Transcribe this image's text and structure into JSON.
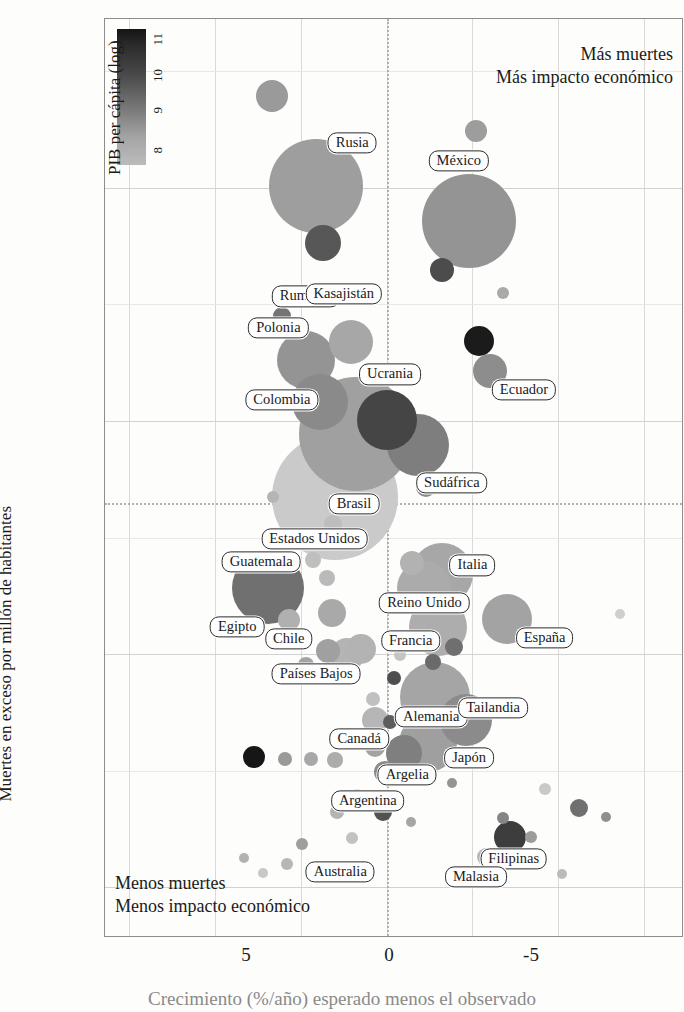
{
  "chart_data": {
    "type": "scatter",
    "title": "",
    "xlabel": "Crecimiento (%/año) esperado menos el observado",
    "ylabel": "Muertes en exceso por millón de habitantes",
    "xticks": [
      "5",
      "0",
      "-5"
    ],
    "xtick_values": [
      5,
      0,
      -5
    ],
    "yticks": [
      "0",
      "2000",
      "4000",
      "6000"
    ],
    "ytick_values": [
      0,
      2000,
      4000,
      6000
    ],
    "xlim": [
      8.2,
      -8.6
    ],
    "ylim": [
      -420,
      7450
    ],
    "grid": true,
    "reference_lines": {
      "vertical_x": 0,
      "horizontal_y": 3300
    },
    "legend": {
      "title": "PIB per cápita (log)",
      "position": "top-left-inside",
      "ticks": [
        "8",
        "9",
        "10",
        "11"
      ],
      "tick_values": [
        8,
        9,
        10,
        11
      ],
      "colormap_low": "#bcbcbc",
      "colormap_high": "#151515"
    },
    "annotations": {
      "top_right_line1": "Más muertes",
      "top_right_line2": "Más impacto económico",
      "bottom_left_line1": "Menos muertes",
      "bottom_left_line2": "Menos impacto económico"
    },
    "size_encoding": "población",
    "points": [
      {
        "name": "Rusia",
        "x": 2.05,
        "y": 6020,
        "r": 47,
        "gdp": 9.3,
        "color": "#9e9e9e",
        "label": true,
        "lx": 1.0,
        "ly": 6390
      },
      {
        "name": "Rumania",
        "x": 1.85,
        "y": 5530,
        "r": 18,
        "gdp": 10.6,
        "color": "#575757",
        "label": true,
        "lx": 2.35,
        "ly": 5070
      },
      {
        "name": "México",
        "x": -2.4,
        "y": 5720,
        "r": 47,
        "gdp": 9.8,
        "color": "#949494",
        "label": true,
        "lx": -2.1,
        "ly": 6230
      },
      {
        "name": "Ecuador",
        "x": -3.0,
        "y": 4430,
        "r": 17,
        "gdp": 9.3,
        "color": "#8d8d8d",
        "label": true,
        "lx": -4.0,
        "ly": 4270
      },
      {
        "name": "Kasajistán",
        "x": 1.05,
        "y": 4680,
        "r": 22,
        "gdp": 9.6,
        "color": "#a7a7a7",
        "label": true,
        "lx": 1.25,
        "ly": 5090
      },
      {
        "name": "Polonia",
        "x": 2.35,
        "y": 4520,
        "r": 29,
        "gdp": 10.4,
        "color": "#949494",
        "label": true,
        "lx": 3.15,
        "ly": 4800
      },
      {
        "name": "Colombia",
        "x": 1.95,
        "y": 4160,
        "r": 28,
        "gdp": 9.6,
        "color": "#8a8a8a",
        "label": true,
        "lx": 3.05,
        "ly": 4180
      },
      {
        "name": "Ucrania",
        "x": 0.0,
        "y": 4010,
        "r": 30,
        "gdp": 9.2,
        "color": "#454545",
        "label": true,
        "lx": -0.1,
        "ly": 4400
      },
      {
        "name": "Brasil",
        "x": 0.9,
        "y": 3890,
        "r": 57,
        "gdp": 9.6,
        "color": "#a0a0a0",
        "label": true,
        "lx": 0.95,
        "ly": 3290
      },
      {
        "name": "Estados Unidos",
        "x": 1.5,
        "y": 3350,
        "r": 63,
        "gdp": 11.1,
        "color": "#cacaca",
        "label": true,
        "lx": 2.1,
        "ly": 2990
      },
      {
        "name": "Sudáfrica",
        "x": -0.9,
        "y": 3790,
        "r": 31,
        "gdp": 9.1,
        "color": "#7e7e7e",
        "label": true,
        "lx": -1.9,
        "ly": 3470
      },
      {
        "name": "Guatemala",
        "x": 2.55,
        "y": 2990,
        "r": 10,
        "gdp": 9.0,
        "color": "#141414",
        "label": true,
        "lx": 3.65,
        "ly": 2790
      },
      {
        "name": "Egipto",
        "x": 3.45,
        "y": 2570,
        "r": 36,
        "gdp": 8.4,
        "color": "#707070",
        "label": true,
        "lx": 4.35,
        "ly": 2230
      },
      {
        "name": "Chile",
        "x": 1.7,
        "y": 2030,
        "r": 12,
        "gdp": 10.1,
        "color": "#a0a0a0",
        "label": true,
        "lx": 2.85,
        "ly": 2130
      },
      {
        "name": "Países Bajos",
        "x": 1.15,
        "y": 1990,
        "r": 17,
        "gdp": 11.0,
        "color": "#b4b4b4",
        "label": true,
        "lx": 2.05,
        "ly": 1830
      },
      {
        "name": "Italia",
        "x": -1.6,
        "y": 2690,
        "r": 31,
        "gdp": 10.6,
        "color": "#a7a7a7",
        "label": true,
        "lx": -2.5,
        "ly": 2760
      },
      {
        "name": "Reino Unido",
        "x": -1.1,
        "y": 2570,
        "r": 27,
        "gdp": 10.7,
        "color": "#ababab",
        "label": true,
        "lx": -1.1,
        "ly": 2440
      },
      {
        "name": "Francia",
        "x": -1.5,
        "y": 2230,
        "r": 29,
        "gdp": 10.7,
        "color": "#adadad",
        "label": true,
        "lx": -0.7,
        "ly": 2110
      },
      {
        "name": "España",
        "x": -3.5,
        "y": 2300,
        "r": 25,
        "gdp": 10.5,
        "color": "#a3a3a3",
        "label": true,
        "lx": -4.6,
        "ly": 2140
      },
      {
        "name": "Alemania",
        "x": -1.4,
        "y": 1630,
        "r": 35,
        "gdp": 10.8,
        "color": "#a5a5a5",
        "label": true,
        "lx": -1.3,
        "ly": 1460
      },
      {
        "name": "Canadá",
        "x": 0.35,
        "y": 1430,
        "r": 13,
        "gdp": 10.8,
        "color": "#b6b6b6",
        "label": true,
        "lx": 0.8,
        "ly": 1270
      },
      {
        "name": "Tailandia",
        "x": -2.3,
        "y": 1430,
        "r": 26,
        "gdp": 9.4,
        "color": "#8b8b8b",
        "label": true,
        "lx": -3.1,
        "ly": 1540
      },
      {
        "name": "Japón",
        "x": -1.2,
        "y": 1240,
        "r": 29,
        "gdp": 10.7,
        "color": "#9f9f9f",
        "label": true,
        "lx": -2.4,
        "ly": 1110
      },
      {
        "name": "Argelia",
        "x": -0.5,
        "y": 1150,
        "r": 18,
        "gdp": 9.0,
        "color": "#7f7f7f",
        "label": true,
        "lx": -0.6,
        "ly": 960
      },
      {
        "name": "Argentina",
        "x": 0.05,
        "y": 990,
        "r": 11,
        "gdp": 9.7,
        "color": "#8a8a8a",
        "label": true,
        "lx": 0.55,
        "ly": 740
      },
      {
        "name": "Filipinas",
        "x": -3.6,
        "y": 430,
        "r": 16,
        "gdp": 8.8,
        "color": "#3d3d3d",
        "label": true,
        "lx": -3.7,
        "ly": 240
      },
      {
        "name": "Malasia",
        "x": -2.9,
        "y": 260,
        "r": 9,
        "gdp": 10.0,
        "color": "#b8b8b8",
        "label": true,
        "lx": -2.6,
        "ly": 90
      },
      {
        "name": "Australia",
        "x": 1.2,
        "y": 130,
        "r": 9,
        "gdp": 10.9,
        "color": "#c6c6c6",
        "label": true,
        "lx": 1.35,
        "ly": 130
      },
      {
        "name": "p1",
        "x": 3.35,
        "y": 6790,
        "r": 16,
        "gdp": 9.7,
        "color": "#9a9a9a",
        "label": false
      },
      {
        "name": "p2",
        "x": -2.6,
        "y": 6490,
        "r": 11,
        "gdp": 9.6,
        "color": "#9d9d9d",
        "label": false
      },
      {
        "name": "p3",
        "x": -1.6,
        "y": 5300,
        "r": 12,
        "gdp": 10.0,
        "color": "#4c4c4c",
        "label": false
      },
      {
        "name": "p4",
        "x": -3.4,
        "y": 5100,
        "r": 6,
        "gdp": 10.1,
        "color": "#a9a9a9",
        "label": false
      },
      {
        "name": "p5",
        "x": 3.05,
        "y": 4900,
        "r": 9,
        "gdp": 10.3,
        "color": "#747474",
        "label": false
      },
      {
        "name": "p6",
        "x": -2.7,
        "y": 4690,
        "r": 15,
        "gdp": 11.0,
        "color": "#1b1b1b",
        "label": false
      },
      {
        "name": "p7",
        "x": 2.15,
        "y": 2810,
        "r": 8,
        "gdp": 10.2,
        "color": "#bfbfbf",
        "label": false
      },
      {
        "name": "p8",
        "x": 1.55,
        "y": 3120,
        "r": 9,
        "gdp": 10.6,
        "color": "#bdbdbd",
        "label": false
      },
      {
        "name": "p9",
        "x": 1.75,
        "y": 2650,
        "r": 8,
        "gdp": 10.3,
        "color": "#bababa",
        "label": false
      },
      {
        "name": "p10",
        "x": 1.6,
        "y": 2350,
        "r": 14,
        "gdp": 10.1,
        "color": "#a9a9a9",
        "label": false
      },
      {
        "name": "p11",
        "x": 2.85,
        "y": 2290,
        "r": 11,
        "gdp": 10.4,
        "color": "#b0b0b0",
        "label": false
      },
      {
        "name": "p12",
        "x": -0.75,
        "y": 2780,
        "r": 12,
        "gdp": 10.8,
        "color": "#b2b2b2",
        "label": false
      },
      {
        "name": "p13",
        "x": 0.75,
        "y": 2040,
        "r": 15,
        "gdp": 10.9,
        "color": "#b3b3b3",
        "label": false
      },
      {
        "name": "p14",
        "x": -1.95,
        "y": 2060,
        "r": 9,
        "gdp": 10.2,
        "color": "#6f6f6f",
        "label": false
      },
      {
        "name": "p15",
        "x": -1.35,
        "y": 1930,
        "r": 8,
        "gdp": 10.0,
        "color": "#6a6a6a",
        "label": false
      },
      {
        "name": "p16",
        "x": 0.4,
        "y": 1610,
        "r": 7,
        "gdp": 10.8,
        "color": "#c0c0c0",
        "label": false
      },
      {
        "name": "p17",
        "x": 0.35,
        "y": 1200,
        "r": 10,
        "gdp": 10.3,
        "color": "#a2a2a2",
        "label": false
      },
      {
        "name": "p18",
        "x": 0.95,
        "y": 1250,
        "r": 9,
        "gdp": 9.9,
        "color": "#989898",
        "label": false
      },
      {
        "name": "p19",
        "x": 2.2,
        "y": 1100,
        "r": 7,
        "gdp": 10.1,
        "color": "#a8a8a8",
        "label": false
      },
      {
        "name": "p20",
        "x": 1.5,
        "y": 1090,
        "r": 8,
        "gdp": 10.1,
        "color": "#acacac",
        "label": false
      },
      {
        "name": "p21",
        "x": 3.85,
        "y": 1120,
        "r": 11,
        "gdp": 10.9,
        "color": "#161616",
        "label": false
      },
      {
        "name": "p22",
        "x": 2.95,
        "y": 1100,
        "r": 7,
        "gdp": 9.8,
        "color": "#9a9a9a",
        "label": false
      },
      {
        "name": "p23",
        "x": -0.1,
        "y": 1420,
        "r": 7,
        "gdp": 10.5,
        "color": "#5d5d5d",
        "label": false
      },
      {
        "name": "p24",
        "x": -0.2,
        "y": 1790,
        "r": 7,
        "gdp": 10.7,
        "color": "#4e4e4e",
        "label": false
      },
      {
        "name": "p25",
        "x": -0.4,
        "y": 1990,
        "r": 6,
        "gdp": 10.9,
        "color": "#c5c5c5",
        "label": false
      },
      {
        "name": "p26",
        "x": -1.9,
        "y": 890,
        "r": 5,
        "gdp": 10.2,
        "color": "#949494",
        "label": false
      },
      {
        "name": "p27",
        "x": -4.6,
        "y": 840,
        "r": 6,
        "gdp": 11.0,
        "color": "#c9c9c9",
        "label": false
      },
      {
        "name": "p28",
        "x": -5.6,
        "y": 680,
        "r": 9,
        "gdp": 9.8,
        "color": "#707070",
        "label": false
      },
      {
        "name": "p29",
        "x": -6.4,
        "y": 600,
        "r": 5,
        "gdp": 10.3,
        "color": "#8f8f8f",
        "label": false
      },
      {
        "name": "p30",
        "x": -3.4,
        "y": 590,
        "r": 6,
        "gdp": 9.4,
        "color": "#858585",
        "label": false
      },
      {
        "name": "p31",
        "x": -4.2,
        "y": 430,
        "r": 6,
        "gdp": 10.2,
        "color": "#9c9c9c",
        "label": false
      },
      {
        "name": "p32",
        "x": 1.45,
        "y": 640,
        "r": 7,
        "gdp": 10.4,
        "color": "#b4b4b4",
        "label": false
      },
      {
        "name": "p33",
        "x": 1.0,
        "y": 420,
        "r": 6,
        "gdp": 10.6,
        "color": "#c2c2c2",
        "label": false
      },
      {
        "name": "p34",
        "x": 2.45,
        "y": 370,
        "r": 6,
        "gdp": 10.0,
        "color": "#9e9e9e",
        "label": false
      },
      {
        "name": "p35",
        "x": 2.9,
        "y": 200,
        "r": 6,
        "gdp": 10.5,
        "color": "#b7b7b7",
        "label": false
      },
      {
        "name": "p36",
        "x": 3.6,
        "y": 120,
        "r": 5,
        "gdp": 10.9,
        "color": "#c8c8c8",
        "label": false
      },
      {
        "name": "p37",
        "x": 0.1,
        "y": 640,
        "r": 9,
        "gdp": 9.5,
        "color": "#525252",
        "label": false
      },
      {
        "name": "p38",
        "x": 0.85,
        "y": 790,
        "r": 6,
        "gdp": 10.6,
        "color": "#c1c1c1",
        "label": false
      },
      {
        "name": "p39",
        "x": -0.7,
        "y": 560,
        "r": 5,
        "gdp": 10.0,
        "color": "#a6a6a6",
        "label": false
      },
      {
        "name": "p40",
        "x": 3.3,
        "y": 3350,
        "r": 6,
        "gdp": 10.4,
        "color": "#b5b5b5",
        "label": false
      },
      {
        "name": "p41",
        "x": 2.35,
        "y": 1910,
        "r": 8,
        "gdp": 10.0,
        "color": "#a4a4a4",
        "label": false
      },
      {
        "name": "p42",
        "x": -6.8,
        "y": 2340,
        "r": 5,
        "gdp": 10.7,
        "color": "#cfcfcf",
        "label": false
      },
      {
        "name": "p43",
        "x": -1.15,
        "y": 3430,
        "r": 10,
        "gdp": 9.2,
        "color": "#8b8b8b",
        "label": false
      },
      {
        "name": "p44",
        "x": 4.15,
        "y": 250,
        "r": 5,
        "gdp": 9.1,
        "color": "#b2b2b2",
        "label": false
      },
      {
        "name": "p45",
        "x": -5.1,
        "y": 110,
        "r": 5,
        "gdp": 10.4,
        "color": "#bbbbbb",
        "label": false
      }
    ]
  }
}
